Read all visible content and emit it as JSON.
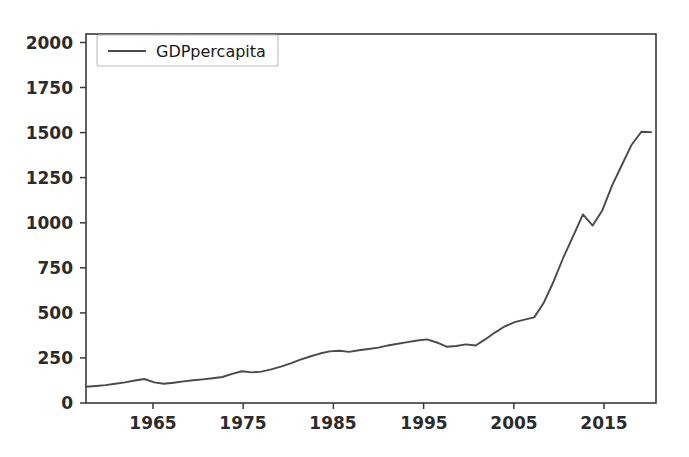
{
  "chart_data": {
    "type": "line",
    "title": "",
    "xlabel": "",
    "ylabel": "",
    "xlim": [
      1960,
      2018.5
    ],
    "ylim": [
      0,
      2000
    ],
    "grid": false,
    "legend_position": "upper left",
    "legend_entries": [
      "GDPpercapita"
    ],
    "xticks": [
      1965,
      1975,
      1985,
      1995,
      2005,
      2015
    ],
    "xtick_labels": [
      "1965",
      "1975",
      "1985",
      "1995",
      "2005",
      "2015"
    ],
    "yticks": [
      0,
      250,
      500,
      750,
      1000,
      1250,
      1500,
      1750,
      2000
    ],
    "ytick_labels": [
      "0",
      "250",
      "500",
      "750",
      "1000",
      "1250",
      "1500",
      "1750",
      "2000"
    ],
    "series": [
      {
        "name": "GDPpercapita",
        "color": "#4a4a4a",
        "x": [
          1960,
          1961,
          1962,
          1963,
          1964,
          1965,
          1966,
          1967,
          1968,
          1969,
          1970,
          1971,
          1972,
          1973,
          1974,
          1975,
          1976,
          1977,
          1978,
          1979,
          1980,
          1981,
          1982,
          1983,
          1984,
          1985,
          1986,
          1987,
          1988,
          1989,
          1990,
          1991,
          1992,
          1993,
          1994,
          1995,
          1996,
          1997,
          1998,
          1999,
          2000,
          2001,
          2002,
          2003,
          2004,
          2005,
          2006,
          2007,
          2008,
          2009,
          2010,
          2011,
          2012,
          2013,
          2014,
          2015,
          2016,
          2017,
          2018
        ],
        "y": [
          88,
          92,
          97,
          104,
          112,
          122,
          130,
          112,
          104,
          110,
          117,
          123,
          128,
          134,
          141,
          158,
          172,
          166,
          170,
          182,
          197,
          215,
          235,
          252,
          268,
          280,
          283,
          277,
          286,
          293,
          300,
          312,
          321,
          330,
          339,
          345,
          328,
          305,
          309,
          318,
          312,
          346,
          383,
          416,
          438,
          452,
          464,
          545,
          660,
          790,
          905,
          1022,
          962,
          1045,
          1180,
          1290,
          1400,
          1470,
          1468
        ],
        "y_extended_notes": "values read from axis; steep rise after 2003, dip 2011-2012, plateau 2014-2015, final rise to ~1950 in 2018",
        "final_value": 1950
      }
    ]
  },
  "legend": {
    "label": "GDPpercapita"
  },
  "axes": {
    "x_tick_labels": [
      "1965",
      "1975",
      "1985",
      "1995",
      "2005",
      "2015"
    ],
    "y_tick_labels": [
      "0",
      "250",
      "500",
      "750",
      "1000",
      "1250",
      "1500",
      "1750",
      "2000"
    ]
  }
}
